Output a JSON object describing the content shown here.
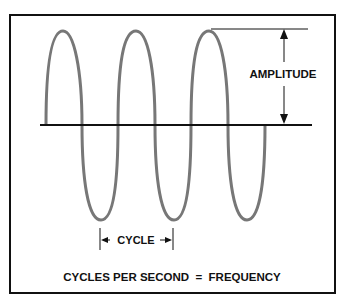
{
  "diagram": {
    "labels": {
      "amplitude": "AMPLITUDE",
      "cycle": "CYCLE",
      "caption": "CYCLES PER SECOND  =  FREQUENCY"
    },
    "colors": {
      "wave": "#777777",
      "lines": "#111111",
      "frame": "#111111"
    }
  }
}
